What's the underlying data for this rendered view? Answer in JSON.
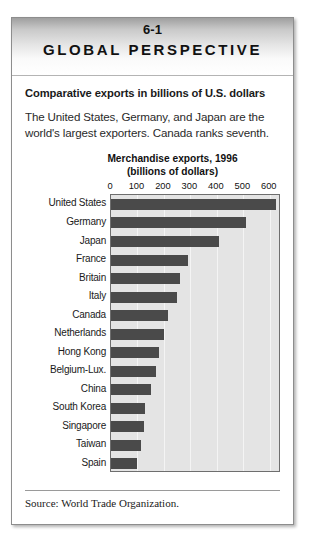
{
  "banner": {
    "number": "6-1",
    "title": "GLOBAL PERSPECTIVE"
  },
  "subtitle": "Comparative exports in billions of U.S. dollars",
  "lede": "The United States, Germany, and Japan are the world's largest exporters. Canada ranks seventh.",
  "footer": {
    "source": "Source: World Trade Organization."
  },
  "chart_data": {
    "type": "bar",
    "orientation": "horizontal",
    "title": "Merchandise exports, 1996",
    "subtitle": "(billions of dollars)",
    "title_line1": "Merchandise exports, 1996",
    "title_line2": "(billions of dollars)",
    "xlabel": "",
    "ylabel": "",
    "xlim": [
      0,
      650
    ],
    "ticks": [
      0,
      100,
      200,
      300,
      400,
      500,
      600
    ],
    "tick_labels": [
      "0",
      "100",
      "200",
      "300",
      "400",
      "500",
      "600"
    ],
    "grid": true,
    "legend": "none",
    "bar_color": "#4a4a4a",
    "plot_bg": "#e4e4e4",
    "categories": [
      "United States",
      "Germany",
      "Japan",
      "France",
      "Britain",
      "Italy",
      "Canada",
      "Netherlands",
      "Hong Kong",
      "Belgium-Lux.",
      "China",
      "South Korea",
      "Singapore",
      "Taiwan",
      "Spain"
    ],
    "values": [
      625,
      510,
      410,
      290,
      260,
      250,
      215,
      200,
      180,
      170,
      150,
      130,
      125,
      115,
      100
    ]
  }
}
